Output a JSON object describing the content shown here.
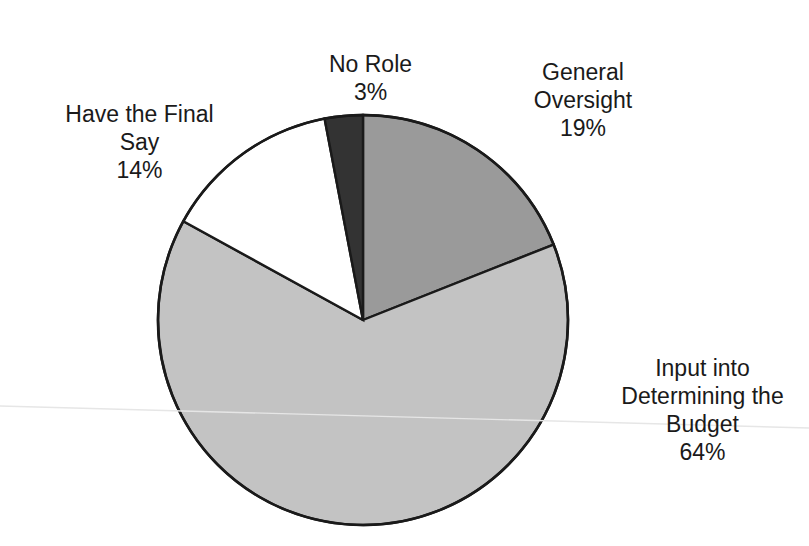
{
  "chart_data": {
    "type": "pie",
    "title": "",
    "subtitle": "",
    "xlabel": "",
    "ylabel": "",
    "legend_position": "none",
    "grid": false,
    "labels_outside": true,
    "value_format": "percent",
    "start_angle_deg": 0,
    "direction": "clockwise",
    "categories": [
      "General Oversight",
      "Input into Determining the Budget",
      "Have the Final Say",
      "No Role"
    ],
    "values": [
      19,
      64,
      14,
      3
    ],
    "slices": [
      {
        "label": "General Oversight",
        "label_lines": "General\nOversight",
        "value": 19,
        "value_text": "19%",
        "color": "#9a9a9a",
        "start_deg": 0,
        "end_deg": 68.4
      },
      {
        "label": "Input into Determining the Budget",
        "label_lines": "Input into\nDetermining the\nBudget",
        "value": 64,
        "value_text": "64%",
        "color": "#c3c3c3",
        "start_deg": 68.4,
        "end_deg": 298.8
      },
      {
        "label": "Have the Final Say",
        "label_lines": "Have the Final\nSay",
        "value": 14,
        "value_text": "14%",
        "color": "#ffffff",
        "start_deg": 298.8,
        "end_deg": 349.2
      },
      {
        "label": "No Role",
        "label_lines": "No Role",
        "value": 3,
        "value_text": "3%",
        "color": "#333333",
        "start_deg": 349.2,
        "end_deg": 360
      }
    ]
  },
  "labels": {
    "no_role": {
      "name": "No Role",
      "percent": "3%"
    },
    "general_oversight": {
      "name": "General\nOversight",
      "percent": "19%"
    },
    "have_final_say": {
      "name": "Have the Final\nSay",
      "percent": "14%"
    },
    "input_budget": {
      "name": "Input into\nDetermining the\nBudget",
      "percent": "64%"
    }
  },
  "style": {
    "background": "#ffffff",
    "outline_color": "#1a1a1a",
    "text_color": "#1a1a1a"
  }
}
